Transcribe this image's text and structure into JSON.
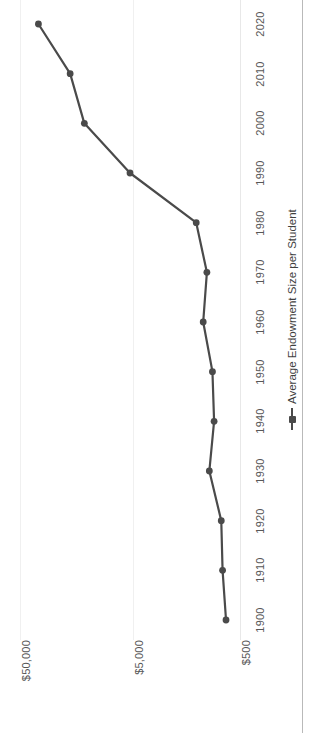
{
  "chart_data": {
    "type": "line",
    "title": "",
    "subtitle": "",
    "xlabel": "",
    "ylabel": "",
    "orientation": "rotated-90",
    "grid": true,
    "yscale": "log",
    "ylim": [
      500,
      50000
    ],
    "ytick_labels": [
      "$50,000",
      "$5,000",
      "$500"
    ],
    "ytick_values": [
      50000,
      5000,
      500
    ],
    "legend_position": "right",
    "legend_entries": [
      "Average Endowment Size per Student"
    ],
    "series": [
      {
        "name": "Average Endowment Size per Student",
        "color": "#4a4a4a",
        "marker": "circle",
        "values": [
          670,
          720,
          740,
          950,
          860,
          890,
          1080,
          1000,
          1250,
          5000,
          13000,
          17500,
          34000
        ]
      }
    ],
    "categories": [
      "1900",
      "1910",
      "1920",
      "1930",
      "1940",
      "1950",
      "1960",
      "1970",
      "1980",
      "1990",
      "2000",
      "2010",
      "2020"
    ],
    "x": [
      1900,
      1910,
      1920,
      1930,
      1940,
      1950,
      1960,
      1970,
      1980,
      1990,
      2000,
      2010,
      2020
    ],
    "xtick_labels": [
      "1900",
      "1910",
      "1920",
      "1930",
      "1940",
      "1950",
      "1960",
      "1970",
      "1980",
      "1990",
      "2000",
      "2010",
      "2020"
    ]
  },
  "colors": {
    "series": "#4a4a4a",
    "gridline": "#f0f0f0",
    "axis_text": "#575757",
    "frame_border": "#b9b9b9",
    "background": "#ffffff"
  }
}
